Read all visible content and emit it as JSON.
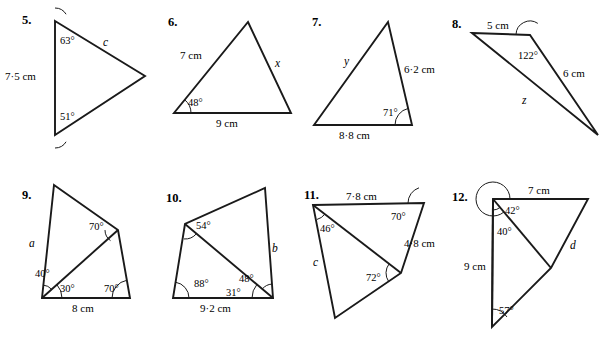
{
  "page": {
    "background": "#ffffff",
    "ink": "#1a1a1a",
    "width": 611,
    "height": 340
  },
  "problems": [
    {
      "number": "5.",
      "num_pos": [
        22,
        14
      ],
      "shape": "triangle",
      "points": "55,21 145,76 55,135",
      "extra_lines": [],
      "labels": [
        {
          "text": "63°",
          "x": 60,
          "y": 36,
          "cls": "ang"
        },
        {
          "text": "51°",
          "x": 60,
          "y": 112,
          "cls": "ang"
        },
        {
          "text": "7·5 cm",
          "x": 5,
          "y": 71,
          "cls": ""
        },
        {
          "text": "c",
          "x": 103,
          "y": 37,
          "cls": "ital"
        }
      ],
      "arcs": [
        {
          "cx": 55,
          "cy": 21,
          "r": 13,
          "a0": 90,
          "a1": 31.4
        },
        {
          "cx": 55,
          "cy": 135,
          "r": 13,
          "a0": 270,
          "a1": 328.6
        }
      ]
    },
    {
      "number": "6.",
      "num_pos": [
        168,
        16
      ],
      "shape": "triangle",
      "points": "248,22 291,113 174,113",
      "extra_lines": [],
      "labels": [
        {
          "text": "48°",
          "x": 188,
          "y": 98,
          "cls": "ang"
        },
        {
          "text": "7 cm",
          "x": 180,
          "y": 50,
          "cls": ""
        },
        {
          "text": "9 cm",
          "x": 216,
          "y": 118,
          "cls": ""
        },
        {
          "text": "x",
          "x": 275,
          "y": 58,
          "cls": "ital"
        }
      ],
      "arcs": [
        {
          "cx": 174,
          "cy": 113,
          "r": 17,
          "a0": 0,
          "a1": 51.2
        }
      ]
    },
    {
      "number": "7.",
      "num_pos": [
        312,
        16
      ],
      "shape": "triangle",
      "points": "388,22 412,125 314,125",
      "extra_lines": [],
      "labels": [
        {
          "text": "71°",
          "x": 383,
          "y": 108,
          "cls": "ang"
        },
        {
          "text": "y",
          "x": 344,
          "y": 56,
          "cls": "ital"
        },
        {
          "text": "6·2 cm",
          "x": 404,
          "y": 64,
          "cls": ""
        },
        {
          "text": "8·8 cm",
          "x": 339,
          "y": 130,
          "cls": ""
        }
      ],
      "arcs": [
        {
          "cx": 412,
          "cy": 125,
          "r": 17,
          "a0": 180,
          "a1": 103.1
        }
      ]
    },
    {
      "number": "8.",
      "num_pos": [
        452,
        18
      ],
      "shape": "triangle",
      "points": "472,33 530,35 598,135",
      "extra_lines": [],
      "labels": [
        {
          "text": "122°",
          "x": 518,
          "y": 51,
          "cls": "ang"
        },
        {
          "text": "5 cm",
          "x": 487,
          "y": 20,
          "cls": ""
        },
        {
          "text": "6 cm",
          "x": 563,
          "y": 68,
          "cls": ""
        },
        {
          "text": "z",
          "x": 522,
          "y": 95,
          "cls": "ital"
        }
      ],
      "arcs": [
        {
          "cx": 530,
          "cy": 35,
          "r": 14,
          "a0": 178,
          "a1": 56.2
        }
      ]
    },
    {
      "number": "9.",
      "num_pos": [
        22,
        189
      ],
      "shape": "quad",
      "points": "54,185 118,230 130,298 42,298",
      "extra_lines": [
        {
          "x1": 42,
          "y1": 298,
          "x2": 118,
          "y2": 230
        }
      ],
      "labels": [
        {
          "text": "70°",
          "x": 89,
          "y": 222,
          "cls": "ang"
        },
        {
          "text": "40°",
          "x": 35,
          "y": 269,
          "cls": "ang"
        },
        {
          "text": "30°",
          "x": 60,
          "y": 284,
          "cls": "ang"
        },
        {
          "text": "70°",
          "x": 104,
          "y": 284,
          "cls": "ang"
        },
        {
          "text": "a",
          "x": 29,
          "y": 238,
          "cls": "ital"
        },
        {
          "text": "8 cm",
          "x": 72,
          "y": 303,
          "cls": ""
        }
      ],
      "arcs": [
        {
          "cx": 118,
          "cy": 230,
          "r": 13,
          "a0": 234.8,
          "a1": 180.2
        },
        {
          "cx": 42,
          "cy": 298,
          "r": 13,
          "a0": 41.8,
          "a1": 85.9
        },
        {
          "cx": 42,
          "cy": 298,
          "r": 20,
          "a0": 0,
          "a1": 41.8
        },
        {
          "cx": 130,
          "cy": 298,
          "r": 18,
          "a0": 180,
          "a1": 100.1
        }
      ]
    },
    {
      "number": "10.",
      "num_pos": [
        166,
        192
      ],
      "shape": "quad",
      "points": "265,188 273,298 173,298 185,224",
      "extra_lines": [
        {
          "x1": 185,
          "y1": 224,
          "x2": 273,
          "y2": 298
        }
      ],
      "labels": [
        {
          "text": "54°",
          "x": 196,
          "y": 221,
          "cls": "ang"
        },
        {
          "text": "88°",
          "x": 194,
          "y": 279,
          "cls": "ang"
        },
        {
          "text": "48°",
          "x": 239,
          "y": 274,
          "cls": "ang"
        },
        {
          "text": "31°",
          "x": 226,
          "y": 288,
          "cls": "ang"
        },
        {
          "text": "b",
          "x": 272,
          "y": 243,
          "cls": "ital"
        },
        {
          "text": "9·2 cm",
          "x": 200,
          "y": 303,
          "cls": ""
        }
      ],
      "arcs": [
        {
          "cx": 185,
          "cy": 224,
          "r": 15,
          "a0": 319.9,
          "a1": 265.8
        },
        {
          "cx": 173,
          "cy": 298,
          "r": 16,
          "a0": 0,
          "a1": 80.8
        },
        {
          "cx": 273,
          "cy": 298,
          "r": 21,
          "a0": 180,
          "a1": 140.0
        },
        {
          "cx": 273,
          "cy": 298,
          "r": 14,
          "a0": 140.0,
          "a1": 94.2
        }
      ]
    },
    {
      "number": "11.",
      "num_pos": [
        304,
        189
      ],
      "shape": "quad",
      "points": "313,205 424,203 401,273 335,318",
      "extra_lines": [
        {
          "x1": 313,
          "y1": 205,
          "x2": 401,
          "y2": 273
        }
      ],
      "labels": [
        {
          "text": "7·8 cm",
          "x": 346,
          "y": 191,
          "cls": ""
        },
        {
          "text": "70°",
          "x": 391,
          "y": 212,
          "cls": "ang"
        },
        {
          "text": "46°",
          "x": 320,
          "y": 224,
          "cls": "ang"
        },
        {
          "text": "72°",
          "x": 366,
          "y": 273,
          "cls": "ang"
        },
        {
          "text": "4·8 cm",
          "x": 404,
          "y": 238,
          "cls": ""
        },
        {
          "text": "c",
          "x": 313,
          "y": 257,
          "cls": "ital"
        }
      ],
      "arcs": [
        {
          "cx": 424,
          "cy": 203,
          "r": 16,
          "a0": 181.0,
          "a1": 108.2
        },
        {
          "cx": 313,
          "cy": 205,
          "r": 15,
          "a0": 285.1,
          "a1": 322.3
        },
        {
          "cx": 401,
          "cy": 273,
          "r": 15,
          "a0": 142.3,
          "a1": 214.3
        }
      ]
    },
    {
      "number": "12.",
      "num_pos": [
        452,
        191
      ],
      "shape": "quad",
      "points": "493,199 588,199 551,268 492,327",
      "extra_lines": [
        {
          "x1": 493,
          "y1": 199,
          "x2": 551,
          "y2": 268
        },
        {
          "x1": 493,
          "y1": 199,
          "x2": 492,
          "y2": 327
        }
      ],
      "labels": [
        {
          "text": "7 cm",
          "x": 528,
          "y": 185,
          "cls": ""
        },
        {
          "text": "42°",
          "x": 505,
          "y": 206,
          "cls": "ang"
        },
        {
          "text": "40°",
          "x": 497,
          "y": 227,
          "cls": "ang"
        },
        {
          "text": "57°",
          "x": 499,
          "y": 306,
          "cls": "ang"
        },
        {
          "text": "9 cm",
          "x": 464,
          "y": 261,
          "cls": ""
        },
        {
          "text": "d",
          "x": 570,
          "y": 240,
          "cls": "ital"
        }
      ],
      "arcs": [
        {
          "cx": 493,
          "cy": 199,
          "r": 17,
          "a0": 0,
          "a1": 310.1
        },
        {
          "cx": 493,
          "cy": 199,
          "r": 11,
          "a0": 310.1,
          "a1": 270.5
        },
        {
          "cx": 492,
          "cy": 327,
          "r": 18,
          "a0": 90.5,
          "a1": 33.9
        }
      ]
    }
  ]
}
